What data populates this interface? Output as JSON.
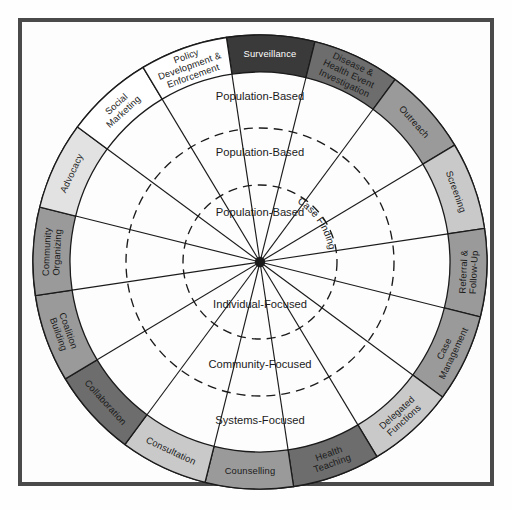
{
  "diagram": {
    "center_dot": "hub",
    "geometry": {
      "center_x": 260,
      "center_y": 262,
      "outer_radius": 227,
      "band_inner_radius": 190,
      "ring_radii": [
        190,
        134,
        77
      ],
      "segment_count": 17,
      "start_angle_deg": -98.5
    },
    "colors": {
      "frame": "#4a4a4a",
      "background": "#fdfdfd",
      "stroke": "#1b1b1b",
      "shade_black": "#3a3a3a",
      "shade_dark": "#6d6d6d",
      "shade_medium": "#9a9a9a",
      "shade_light": "#c9c9c9",
      "shade_white": "#ffffff",
      "text_dark": "#1b1b1b",
      "text_light": "#ffffff"
    },
    "outer_segments": [
      {
        "label": "Surveillance",
        "shade": "#3a3a3a",
        "text": "#ffffff",
        "orient": "horizontal",
        "lines": [
          "Surveillance"
        ]
      },
      {
        "label": "Disease & Health Event Investigation",
        "shade": "#6d6d6d",
        "text": "#1b1b1b",
        "orient": "radial",
        "lines": [
          "Disease &",
          "Health Event",
          "Investigation"
        ]
      },
      {
        "label": "Outreach",
        "shade": "#9a9a9a",
        "text": "#1b1b1b",
        "orient": "radial",
        "lines": [
          "Outreach"
        ]
      },
      {
        "label": "Screening",
        "shade": "#c9c9c9",
        "text": "#1b1b1b",
        "orient": "radial",
        "lines": [
          "Screening"
        ]
      },
      {
        "label": "Referral & Follow-Up",
        "shade": "#9a9a9a",
        "text": "#1b1b1b",
        "orient": "radial",
        "lines": [
          "Referral &",
          "Follow-Up"
        ]
      },
      {
        "label": "Case Management",
        "shade": "#9a9a9a",
        "text": "#1b1b1b",
        "orient": "radial",
        "lines": [
          "Case",
          "Management"
        ]
      },
      {
        "label": "Delegated Functions",
        "shade": "#c9c9c9",
        "text": "#1b1b1b",
        "orient": "radial",
        "lines": [
          "Delegated",
          "Functions"
        ]
      },
      {
        "label": "Health Teaching",
        "shade": "#6d6d6d",
        "text": "#1b1b1b",
        "orient": "radial",
        "lines": [
          "Health",
          "Teaching"
        ]
      },
      {
        "label": "Counselling",
        "shade": "#9a9a9a",
        "text": "#1b1b1b",
        "orient": "horizontal",
        "lines": [
          "Counselling"
        ]
      },
      {
        "label": "Consultation",
        "shade": "#c9c9c9",
        "text": "#1b1b1b",
        "orient": "radial",
        "lines": [
          "Consultation"
        ]
      },
      {
        "label": "Collaboration",
        "shade": "#6d6d6d",
        "text": "#1b1b1b",
        "orient": "radial",
        "lines": [
          "Collaboration"
        ]
      },
      {
        "label": "Coalition Building",
        "shade": "#9a9a9a",
        "text": "#1b1b1b",
        "orient": "radial",
        "lines": [
          "Coalition",
          "Building"
        ]
      },
      {
        "label": "Community Organizing",
        "shade": "#9a9a9a",
        "text": "#1b1b1b",
        "orient": "radial",
        "lines": [
          "Community",
          "Organizing"
        ]
      },
      {
        "label": "Advocacy",
        "shade": "#e2e2e2",
        "text": "#1b1b1b",
        "orient": "radial",
        "lines": [
          "Advocacy"
        ]
      },
      {
        "label": "Social Marketing",
        "shade": "#ffffff",
        "text": "#1b1b1b",
        "orient": "radial",
        "lines": [
          "Social",
          "Marketing"
        ]
      },
      {
        "label": "Policy Development & Enforcement",
        "shade": "#ffffff",
        "text": "#1b1b1b",
        "orient": "radial",
        "lines": [
          "Policy",
          "Development &",
          "Enforcement"
        ]
      }
    ],
    "ring_labels_top": [
      {
        "text": "Population-Based",
        "radius": 162
      },
      {
        "text": "Population-Based",
        "radius": 106
      },
      {
        "text": "Population-Based",
        "radius": 46
      }
    ],
    "ring_labels_bottom": [
      {
        "text": "Individual-Focused",
        "radius": 46
      },
      {
        "text": "Community-Focused",
        "radius": 106
      },
      {
        "text": "Systems-Focused",
        "radius": 162
      }
    ],
    "case_finding_label": "Case Finding"
  }
}
